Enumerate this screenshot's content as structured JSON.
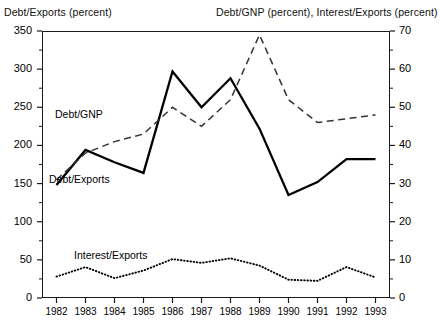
{
  "captions": {
    "left": "Debt/Exports (percent)",
    "right": "Debt/GNP (percent), Interest/Exports (percent)"
  },
  "series_labels": {
    "debt_gnp": "Debt/GNP",
    "debt_exports": "Debt/Exports",
    "interest_exports": "Interest/Exports"
  },
  "colors": {
    "axis": "#1a1a1a",
    "solid_line": "#000000",
    "dashed_line": "#333333",
    "dotted_line": "#000000"
  },
  "chart_data": {
    "type": "line",
    "title": "",
    "subtitle": "",
    "xlabel": "",
    "ylabel": "Debt/Exports (percent)",
    "y2label": "Debt/GNP (percent), Interest/Exports (percent)",
    "grid": false,
    "legend": "inline-annotations",
    "categories": [
      1982,
      1983,
      1984,
      1985,
      1986,
      1987,
      1988,
      1989,
      1990,
      1991,
      1992,
      1993
    ],
    "x": [
      "1982",
      "1983",
      "1984",
      "1985",
      "1986",
      "1987",
      "1988",
      "1989",
      "1990",
      "1991",
      "1992",
      "1993"
    ],
    "ylim": [
      0,
      350
    ],
    "yticks": [
      0,
      50,
      100,
      150,
      200,
      250,
      300,
      350
    ],
    "y2lim": [
      0,
      70
    ],
    "y2ticks": [
      0,
      10,
      20,
      30,
      40,
      50,
      60,
      70
    ],
    "series": [
      {
        "name": "Debt/Exports",
        "axis": "left",
        "style": "solid",
        "unit": "percent",
        "values": [
          148,
          194,
          178,
          164,
          297,
          250,
          288,
          222,
          135,
          152,
          182,
          182
        ]
      },
      {
        "name": "Debt/GNP",
        "axis": "right",
        "style": "dashed",
        "unit": "percent",
        "values": [
          31,
          38,
          41,
          43,
          50,
          45,
          52,
          69,
          52,
          46,
          47,
          48
        ]
      },
      {
        "name": "Interest/Exports",
        "axis": "right",
        "style": "dotted",
        "unit": "percent",
        "values": [
          5.6,
          8.1,
          5.2,
          7.2,
          10.2,
          9.2,
          10.4,
          8.5,
          4.8,
          4.5,
          8.1,
          5.4
        ]
      }
    ]
  }
}
